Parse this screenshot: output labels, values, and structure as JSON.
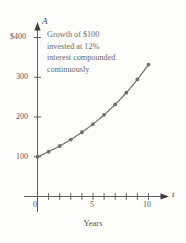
{
  "chart_data": {
    "type": "line",
    "title": "",
    "subtitle": "",
    "annotation_lines": [
      "Growth of $100",
      "invested at 12%",
      "interest compounded",
      "continuously"
    ],
    "xlabel": "Years",
    "ylabel": "",
    "x_axis_symbol": "t",
    "y_axis_symbol": "A",
    "xlim": [
      0,
      11
    ],
    "ylim": [
      0,
      430
    ],
    "grid": false,
    "legend": null,
    "x_tick_labels": [
      "0",
      "5",
      "10"
    ],
    "x_tick_values": [
      0,
      5,
      10
    ],
    "x_minor_tick_values": [
      1,
      2,
      3,
      4,
      5,
      6,
      7,
      8,
      9,
      10
    ],
    "y_tick_labels": [
      "100",
      "200",
      "300",
      "$400"
    ],
    "y_tick_values": [
      100,
      200,
      300,
      400
    ],
    "series": [
      {
        "name": "A = 100e^(0.12t)",
        "markers": "filled-circle",
        "x": [
          0,
          1,
          2,
          3,
          4,
          5,
          6,
          7,
          8,
          9,
          10
        ],
        "values": [
          100,
          112.7,
          127.1,
          143.3,
          161.6,
          182.2,
          205.4,
          231.6,
          261.2,
          294.5,
          332.0
        ]
      }
    ]
  },
  "labels": {
    "y_axis_symbol": "A",
    "x_axis_symbol": "t",
    "y_tick_400": "$400",
    "y_tick_300": "300",
    "y_tick_200": "200",
    "y_tick_100": "100",
    "x_tick_0": "0",
    "x_tick_5": "5",
    "x_tick_10": "10",
    "x_axis_title": "Years",
    "annotation_line_1": "Growth of $100",
    "annotation_line_2": "invested at 12%",
    "annotation_line_3": "interest compounded",
    "annotation_line_4": "continuously"
  },
  "colors": {
    "background": "#fdfdfc",
    "axis": "#5d5d5d",
    "curve": "#6b6b6b",
    "marker": "#6e6e6e",
    "text": "#585858",
    "annotation_text": "#6a6a6a"
  }
}
